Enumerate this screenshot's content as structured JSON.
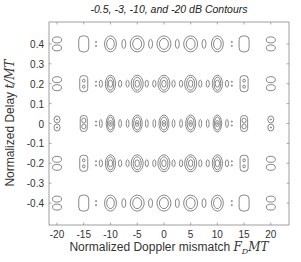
{
  "chart_data": {
    "type": "contour",
    "title": "-0.5, -3, -10, and -20 dB Contours",
    "xlabel_text": "Normalized Doppler mismatch ",
    "xlabel_math": "F",
    "xlabel_math_sub": "D",
    "xlabel_math_tail": "MT",
    "ylabel_text": "Normalized Delay ",
    "ylabel_math": "t/MT",
    "contour_levels_db": [
      -0.5,
      -3,
      -10,
      -20
    ],
    "xlim": [
      -21.5,
      23.4
    ],
    "ylim": [
      -0.51,
      0.51
    ],
    "xticks": [
      -20,
      -15,
      -10,
      -5,
      0,
      5,
      10,
      15,
      20
    ],
    "xtick_labels": [
      "-20",
      "-15",
      "-10",
      "-5",
      "0",
      "5",
      "10",
      "15",
      "20"
    ],
    "yticks": [
      0.4,
      0.3,
      0.2,
      0.1,
      0,
      -0.1,
      -0.2,
      -0.3,
      -0.4
    ],
    "ytick_labels": [
      "0.4",
      "0.3",
      "0.2",
      "0.1",
      "0",
      "-0.1",
      "-0.2",
      "-0.3",
      "-0.4"
    ],
    "grid": false,
    "line_color": "#555555",
    "rows": [
      {
        "delay": 0.4,
        "peaks_doppler": [
          -20,
          -15,
          -10,
          -5,
          0,
          5,
          10,
          15,
          20
        ],
        "style": "wide"
      },
      {
        "delay": 0.2,
        "peaks_doppler": [
          -20,
          -15,
          -10,
          -5,
          0,
          5,
          10,
          15,
          20
        ],
        "style": "medium"
      },
      {
        "delay": 0,
        "peaks_doppler": [
          -20,
          -15,
          -10,
          -5,
          0,
          5,
          10,
          15,
          20
        ],
        "style": "narrow"
      },
      {
        "delay": -0.2,
        "peaks_doppler": [
          -20,
          -15,
          -10,
          -5,
          0,
          5,
          10,
          15,
          20
        ],
        "style": "medium"
      },
      {
        "delay": -0.4,
        "peaks_doppler": [
          -20,
          -15,
          -10,
          -5,
          0,
          5,
          10,
          15,
          20
        ],
        "style": "wide"
      }
    ]
  }
}
